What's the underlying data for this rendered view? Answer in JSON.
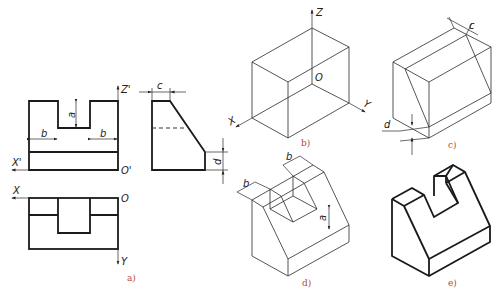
{
  "figure": {
    "panels": [
      {
        "id": "a",
        "caption": "a)",
        "description": "Three orthographic views (front, side, top)"
      },
      {
        "id": "b",
        "caption": "b)",
        "description": "Isometric bounding box with axes"
      },
      {
        "id": "c",
        "caption": "c)",
        "description": "Bounding box with sloped cut"
      },
      {
        "id": "d",
        "caption": "d)",
        "description": "Cut box with slot marked"
      },
      {
        "id": "e",
        "caption": "e)",
        "description": "Finished isometric solid"
      }
    ],
    "axis_labels": {
      "z_prime": "Z'",
      "x_prime": "X'",
      "o_prime": "O'",
      "x": "X",
      "o": "O",
      "y": "Y",
      "z": "Z"
    },
    "dimension_labels": {
      "a": "a",
      "b": "b",
      "c": "c",
      "d": "d"
    },
    "colors": {
      "line": "#1a1a1a",
      "caption": "#b04a3a",
      "background": "#ffffff"
    }
  }
}
